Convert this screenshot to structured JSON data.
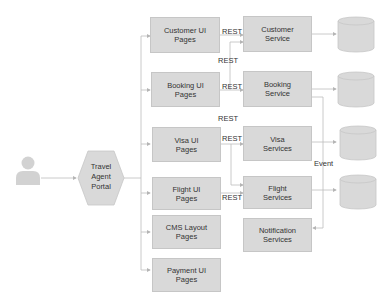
{
  "actor": {
    "label": ""
  },
  "portal": {
    "label_line1": "Travel",
    "label_line2": "Agent",
    "label_line3": "Portal"
  },
  "ui_pages": [
    {
      "line1": "Customer UI",
      "line2": "Pages"
    },
    {
      "line1": "Booking UI",
      "line2": "Pages"
    },
    {
      "line1": "Visa UI",
      "line2": "Pages"
    },
    {
      "line1": "Flight UI",
      "line2": "Pages"
    },
    {
      "line1": "CMS Layout",
      "line2": "Pages"
    },
    {
      "line1": "Payment UI",
      "line2": "Pages"
    }
  ],
  "services": [
    {
      "line1": "Customer",
      "line2": "Service"
    },
    {
      "line1": "Booking",
      "line2": "Service"
    },
    {
      "line1": "Visa",
      "line2": "Services"
    },
    {
      "line1": "Flight",
      "line2": "Services"
    },
    {
      "line1": "Notification",
      "line2": "Services"
    }
  ],
  "edge_labels": {
    "rest": "REST",
    "event": "Event"
  },
  "colors": {
    "box_fill": "#d9d9d9",
    "box_stroke": "#c6c6c6",
    "line": "#bdbdbd",
    "text": "#333333"
  }
}
